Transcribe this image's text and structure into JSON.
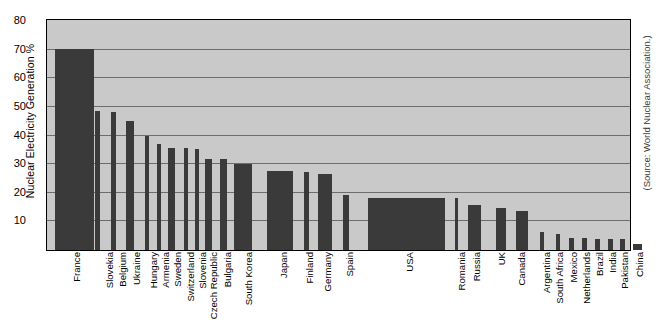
{
  "chart_data": {
    "type": "bar",
    "title": "",
    "subtitle": "",
    "xlabel": "",
    "ylabel": "Nuclear Electricity Generation %",
    "ylim": [
      0,
      80
    ],
    "yticks": [
      10,
      20,
      30,
      40,
      50,
      60,
      70,
      80
    ],
    "grid": true,
    "legend": null,
    "bar_color": "#3a3a3a",
    "plot_background": "#c9c9c9",
    "annotations": [
      "(Source: World Nuclear Association.)"
    ],
    "categories": [
      "France",
      "Slovekia",
      "Belgium",
      "Ukraine",
      "Hungary",
      "Armenia",
      "Sweden",
      "Switzerland",
      "Slovenia",
      "Czech Republic",
      "Bulgaria",
      "South Korea",
      "Japan",
      "Finland",
      "Germany",
      "Spain",
      "USA",
      "Romania",
      "Russia",
      "UK",
      "Canada",
      "Argentina",
      "South Africa",
      "Mexico",
      "Netherlands",
      "Brazil",
      "India",
      "Pakistan",
      "China"
    ],
    "values": [
      70,
      48.5,
      48,
      45,
      39.5,
      37,
      35.5,
      35.5,
      35,
      31.5,
      31.5,
      30,
      27.5,
      27,
      26.5,
      19,
      18,
      18,
      15.5,
      14.5,
      13.5,
      6,
      5.5,
      4,
      4,
      3.5,
      3.5,
      3.5,
      2
    ],
    "bar_widths_px": [
      39,
      5,
      5,
      8,
      4,
      4,
      7,
      4,
      4,
      7,
      7,
      18,
      26,
      5,
      14,
      6,
      77,
      3,
      13,
      10,
      12,
      4,
      4,
      5,
      5,
      5,
      5,
      5,
      9
    ],
    "bar_left_px": [
      7,
      47,
      63,
      78,
      97,
      109,
      120,
      136,
      147,
      157,
      172,
      186,
      219,
      256,
      270,
      295,
      320,
      407,
      420,
      448,
      468,
      492,
      508,
      521,
      534,
      547,
      560,
      572,
      585
    ],
    "label_left_px": [
      72,
      105,
      118,
      132,
      149,
      161,
      173,
      186,
      198,
      209,
      223,
      244,
      279,
      305,
      323,
      345,
      405,
      457,
      472,
      497,
      517,
      542,
      555,
      569,
      582,
      595,
      608,
      620,
      635
    ]
  },
  "source": {
    "note": "(Source: World Nuclear Association.)"
  },
  "axis": {
    "y_title": "Nuclear Electricity Generation %",
    "y_tick_labels": [
      "80",
      "70",
      "60",
      "50",
      "40",
      "30",
      "20",
      "10"
    ]
  }
}
